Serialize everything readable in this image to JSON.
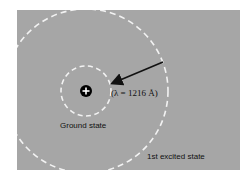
{
  "diagram": {
    "background_color": "#a6a6a6",
    "orbit_color": "#f2f2f2",
    "nucleus": {
      "symbol": "+",
      "color": "#000000"
    },
    "labels": {
      "ground_state": "Ground state",
      "excited_state": "1st excited state",
      "wavelength": "(λ = 1216 Å)"
    },
    "transition": {
      "from": "1st excited state",
      "to": "Ground state",
      "wavelength_angstrom": 1216
    }
  }
}
